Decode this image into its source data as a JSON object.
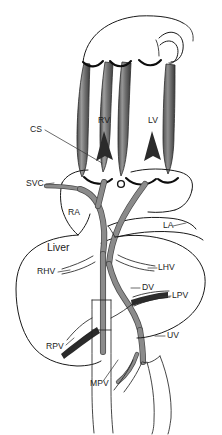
{
  "figure": {
    "width": 222,
    "height": 435,
    "background_color": "#ffffff",
    "line_color": "#1a1a1a",
    "vessel_fill_color": "#8b8b8b",
    "vessel_edge_color": "#4a4a4a",
    "label_color": "#1c1c1c"
  },
  "labels": [
    {
      "id": "cs",
      "text": "CS",
      "x": 30,
      "y": 130,
      "size": "small",
      "anchor": "start"
    },
    {
      "id": "rv",
      "text": "RV",
      "x": 104,
      "y": 121,
      "size": "small",
      "anchor": "middle"
    },
    {
      "id": "lv",
      "text": "LV",
      "x": 153,
      "y": 121,
      "size": "small",
      "anchor": "middle"
    },
    {
      "id": "svc",
      "text": "SVC",
      "x": 26,
      "y": 184,
      "size": "small",
      "anchor": "start"
    },
    {
      "id": "ra",
      "text": "RA",
      "x": 68,
      "y": 213,
      "size": "small",
      "anchor": "start"
    },
    {
      "id": "la",
      "text": "LA",
      "x": 163,
      "y": 226,
      "size": "small",
      "anchor": "start"
    },
    {
      "id": "liver",
      "text": "Liver",
      "x": 47,
      "y": 248,
      "size": "big",
      "anchor": "start"
    },
    {
      "id": "rhv",
      "text": "RHV",
      "x": 37,
      "y": 272,
      "size": "small",
      "anchor": "start"
    },
    {
      "id": "lhv",
      "text": "LHV",
      "x": 158,
      "y": 268,
      "size": "small",
      "anchor": "start"
    },
    {
      "id": "dv",
      "text": "DV",
      "x": 142,
      "y": 288,
      "size": "small",
      "anchor": "start"
    },
    {
      "id": "lpv",
      "text": "LPV",
      "x": 172,
      "y": 296,
      "size": "small",
      "anchor": "start"
    },
    {
      "id": "rpv",
      "text": "RPV",
      "x": 46,
      "y": 347,
      "size": "small",
      "anchor": "start"
    },
    {
      "id": "uv",
      "text": "UV",
      "x": 167,
      "y": 336,
      "size": "small",
      "anchor": "start"
    },
    {
      "id": "mpv",
      "text": "MPV",
      "x": 90,
      "y": 384,
      "size": "small",
      "anchor": "start"
    }
  ],
  "legend_expansions": {
    "CS": "Coronary sinus",
    "RV": "Right ventricle",
    "LV": "Left ventricle",
    "SVC": "Superior vena cava",
    "RA": "Right atrium",
    "LA": "Left atrium",
    "RHV": "Right hepatic vein",
    "LHV": "Left hepatic vein",
    "DV": "Ductus venosus",
    "LPV": "Left portal vein",
    "RPV": "Right portal vein",
    "UV": "Umbilical vein",
    "MPV": "Main portal vein"
  }
}
